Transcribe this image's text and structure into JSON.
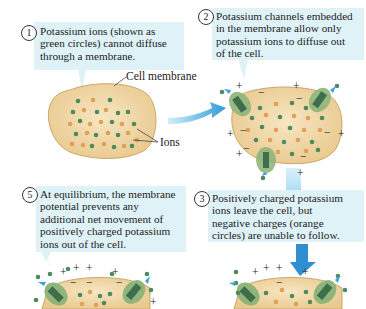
{
  "colors": {
    "callout_bg": "#dff2f8",
    "cell_fill": "#f0d7a6",
    "cell_stroke": "#c9a86a",
    "potassium_ion": "#4d8a5e",
    "negative_ion": "#e0a055",
    "channel": "#7fa96a",
    "arrow": "#3ea3dc"
  },
  "steps": [
    {
      "number": "1",
      "text_lines": [
        "Potassium ions (shown as",
        "green circles) cannot diffuse",
        "through a membrane."
      ]
    },
    {
      "number": "2",
      "text_lines": [
        "Potassium channels embedded",
        "in the membrane allow only",
        "potassium ions to diffuse out",
        "of the cell."
      ]
    },
    {
      "number": "3",
      "text_lines": [
        "Positively charged potassium",
        "ions leave the cell, but",
        "negative charges (orange",
        "circles) are unable to follow."
      ]
    },
    {
      "number": "5",
      "text_lines": [
        "At equilibrium, the membrane",
        "potential prevents any",
        "additional net movement of",
        "positively charged potassium",
        "ions out of the cell."
      ]
    }
  ],
  "labels": {
    "cell_membrane": "Cell membrane",
    "ions": "Ions"
  },
  "charges": {
    "positive": "+",
    "negative": "−"
  }
}
